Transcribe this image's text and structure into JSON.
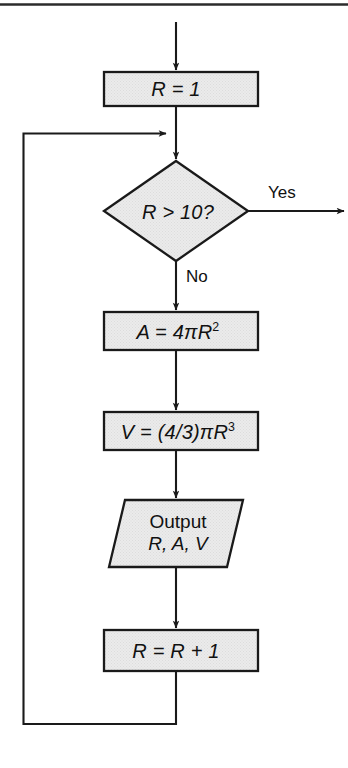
{
  "figure": {
    "type": "flowchart",
    "title": "",
    "top_rule": true,
    "background_color": "#ffffff",
    "shape_fill": "#e9e9e9",
    "stroke_color": "#1a1a1a"
  },
  "nodes": {
    "init": {
      "shape": "process-rectangle",
      "label": "R = 1",
      "var": "R",
      "operator": "=",
      "value": "1"
    },
    "decision": {
      "shape": "decision-diamond",
      "label": "R > 10?",
      "var": "R",
      "operator": ">",
      "value": "10"
    },
    "area": {
      "shape": "process-rectangle",
      "label": "A = 4πR",
      "exponent": "2",
      "full_label": "A = 4πR²"
    },
    "volume": {
      "shape": "process-rectangle",
      "label": "V = (4/3)πR",
      "exponent": "3",
      "full_label": "V = (4/3)πR³"
    },
    "output": {
      "shape": "io-parallelogram",
      "line1": "Output",
      "line2": "R, A, V"
    },
    "increment": {
      "shape": "process-rectangle",
      "label": "R = R + 1",
      "var": "R",
      "operator": "=",
      "value": "R + 1"
    }
  },
  "edges": {
    "entry": {
      "from": "start",
      "to": "init",
      "label": ""
    },
    "init_to_decision": {
      "from": "init",
      "to": "decision",
      "label": ""
    },
    "decision_yes": {
      "from": "decision",
      "to": "exit",
      "label": "Yes",
      "direction": "right"
    },
    "decision_no": {
      "from": "decision",
      "to": "area",
      "label": "No",
      "direction": "down"
    },
    "area_to_volume": {
      "from": "area",
      "to": "volume",
      "label": ""
    },
    "volume_to_output": {
      "from": "volume",
      "to": "output",
      "label": ""
    },
    "output_to_increment": {
      "from": "output",
      "to": "increment",
      "label": ""
    },
    "loop_back": {
      "from": "increment",
      "to": "decision",
      "label": "",
      "direction": "left-up"
    }
  }
}
